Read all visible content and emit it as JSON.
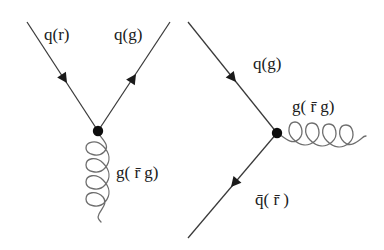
{
  "figure": {
    "kind": "feynman-diagrams",
    "background_color": "#ffffff",
    "line_color": "#3a3a3a",
    "gluon_color": "#6e6e6e",
    "vertex_color": "#0d0d0d",
    "text_color": "#1a1a1a",
    "diagrams": [
      {
        "id": "left",
        "name": "quark-gluon-emission-vertex",
        "vertex": {
          "x": 98,
          "y": 131
        },
        "labels": {
          "incoming_quark": "q(r)",
          "outgoing_quark": "q(g)",
          "gluon": "g( r̄ g)"
        },
        "label_positions": {
          "incoming_quark": {
            "x": 44,
            "y": 40
          },
          "outgoing_quark": {
            "x": 114,
            "y": 40
          },
          "gluon": {
            "x": 116,
            "y": 172
          }
        },
        "lines": [
          {
            "name": "incoming-quark-line",
            "from": {
              "x": 27,
              "y": 22
            },
            "to": {
              "x": 98,
              "y": 131
            },
            "arrow_at": {
              "x": 62,
              "y": 76
            },
            "arrow_direction": "down-right"
          },
          {
            "name": "outgoing-quark-line",
            "from": {
              "x": 98,
              "y": 131
            },
            "to": {
              "x": 170,
              "y": 22
            },
            "arrow_at": {
              "x": 134,
              "y": 76
            },
            "arrow_direction": "up-right"
          }
        ],
        "gluon": {
          "name": "gluon-propagator",
          "orientation": "vertical-down",
          "from": {
            "x": 98,
            "y": 131
          },
          "to": {
            "x": 100,
            "y": 222
          },
          "loops": 4
        }
      },
      {
        "id": "right",
        "name": "quark-antiquark-annihilation-vertex",
        "vertex": {
          "x": 277,
          "y": 133
        },
        "labels": {
          "incoming_quark": "q(g)",
          "outgoing_antiquark": "q̄( r̄ )",
          "gluon": "g( r̄ g)"
        },
        "label_positions": {
          "incoming_quark": {
            "x": 253,
            "y": 69
          },
          "gluon": {
            "x": 292,
            "y": 112
          },
          "outgoing_antiquark": {
            "x": 255,
            "y": 199
          }
        },
        "lines": [
          {
            "name": "incoming-quark-line",
            "from": {
              "x": 188,
              "y": 22
            },
            "to": {
              "x": 277,
              "y": 133
            },
            "arrow_at": {
              "x": 231,
              "y": 76
            },
            "arrow_direction": "down-right"
          },
          {
            "name": "outgoing-antiquark-line",
            "from": {
              "x": 277,
              "y": 133
            },
            "to": {
              "x": 188,
              "y": 238
            },
            "arrow_at": {
              "x": 234,
              "y": 186
            },
            "arrow_direction": "down-left"
          }
        ],
        "gluon": {
          "name": "gluon-propagator",
          "orientation": "horizontal-right",
          "from": {
            "x": 277,
            "y": 133
          },
          "to": {
            "x": 365,
            "y": 136
          },
          "loops": 4
        }
      }
    ]
  }
}
